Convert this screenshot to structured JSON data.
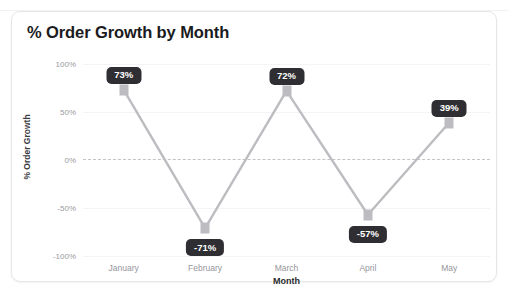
{
  "card": {
    "title": "% Order Growth by Month"
  },
  "chart_data": {
    "type": "line",
    "title": "% Order Growth by Month",
    "xlabel": "Month",
    "ylabel": "% Order Growth",
    "categories": [
      "January",
      "February",
      "March",
      "April",
      "May"
    ],
    "values": [
      73,
      -71,
      72,
      -57,
      39
    ],
    "data_labels": [
      "73%",
      "-71%",
      "72%",
      "-57%",
      "39%"
    ],
    "label_positions": [
      "above",
      "below",
      "above",
      "below",
      "above"
    ],
    "ylim": [
      -100,
      100
    ],
    "yticks": [
      100,
      50,
      0,
      -50,
      -100
    ],
    "ytick_labels": [
      "100%",
      "50%",
      "0%",
      "-50%",
      "-100%"
    ],
    "grid": true,
    "zero_line": true,
    "legend": "none",
    "colors": {
      "line": "#bdbdc1",
      "marker": "#bdbdc1",
      "label_badge": "#2f2f33",
      "label_text": "#ffffff",
      "zero_line": "#c2c2c7",
      "gridline": "#f4f4f6",
      "tick_text": "#96969c",
      "title_text": "#1b1b1d",
      "card_background": "#ffffff",
      "card_border": "#e6e6e9"
    }
  }
}
